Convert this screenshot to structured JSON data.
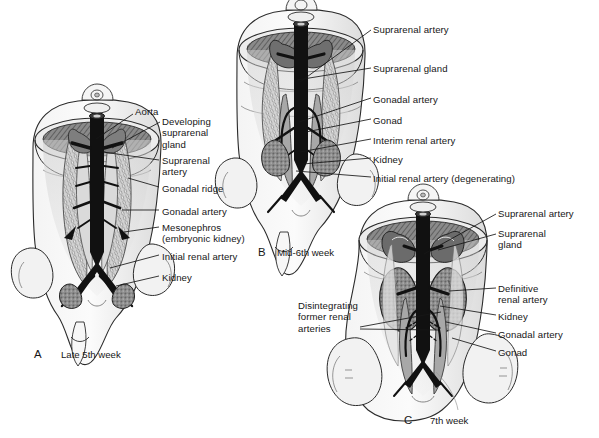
{
  "figure": {
    "background_color": "#ffffff",
    "ink_color": "#161616",
    "vessel_color": "#111111",
    "organ_gray": "#8d8d8d",
    "body_gray": "#e8e8e8",
    "panel_count": 3
  },
  "panels": [
    {
      "id": "A",
      "letter": "A",
      "caption": "Late 5th week",
      "letter_pos": {
        "x": 34,
        "y": 348
      },
      "caption_pos": {
        "x": 61,
        "y": 349
      },
      "labels": [
        {
          "name": "aorta",
          "text": "Aorta",
          "x": 135,
          "y": 106,
          "lines": [
            [
              133,
              114,
              96,
              139
            ]
          ]
        },
        {
          "name": "developing-suprarenal-gland",
          "text": "Developing\nsuprarenal\ngland",
          "x": 162,
          "y": 116,
          "lines": [
            [
              160,
              122,
              112,
              148
            ]
          ]
        },
        {
          "name": "suprarenal-artery",
          "text": "Suprarenal\nartery",
          "x": 162,
          "y": 155,
          "lines": [
            [
              159,
              160,
              103,
              152
            ]
          ]
        },
        {
          "name": "gonadal-ridge",
          "text": "Gonadal ridge",
          "x": 162,
          "y": 183,
          "lines": [
            [
              159,
              187,
              128,
              178
            ]
          ]
        },
        {
          "name": "gonadal-artery",
          "text": "Gonadal artery",
          "x": 162,
          "y": 206,
          "lines": [
            [
              159,
              210,
              122,
              210
            ]
          ]
        },
        {
          "name": "mesonephros",
          "text": "Mesonephros\n(embryonic kidney)",
          "x": 162,
          "y": 222,
          "lines": [
            [
              159,
              227,
              124,
              232
            ]
          ]
        },
        {
          "name": "initial-renal-artery",
          "text": "Initial renal artery",
          "x": 162,
          "y": 251,
          "lines": [
            [
              159,
              255,
              110,
              268
            ]
          ]
        },
        {
          "name": "kidney",
          "text": "Kidney",
          "x": 162,
          "y": 272,
          "lines": [
            [
              159,
              276,
              116,
              286
            ]
          ]
        }
      ]
    },
    {
      "id": "B",
      "letter": "B",
      "caption": "Mid-6th week",
      "letter_pos": {
        "x": 258,
        "y": 246
      },
      "caption_pos": {
        "x": 277,
        "y": 247
      },
      "labels": [
        {
          "name": "suprarenal-artery",
          "text": "Suprarenal artery",
          "x": 373,
          "y": 24,
          "lines": [
            [
              371,
              30,
              300,
              82
            ]
          ]
        },
        {
          "name": "suprarenal-gland",
          "text": "Suprarenal gland",
          "x": 373,
          "y": 63,
          "lines": [
            [
              371,
              68,
              297,
              80
            ]
          ]
        },
        {
          "name": "gonadal-artery",
          "text": "Gonadal artery",
          "x": 373,
          "y": 94,
          "lines": [
            [
              371,
              98,
              299,
              122
            ]
          ]
        },
        {
          "name": "gonad",
          "text": "Gonad",
          "x": 373,
          "y": 115,
          "lines": [
            [
              371,
              119,
              306,
              132
            ]
          ]
        },
        {
          "name": "interim-renal-artery",
          "text": "Interim renal artery",
          "x": 373,
          "y": 135,
          "lines": [
            [
              371,
              139,
              300,
              152
            ]
          ]
        },
        {
          "name": "kidney",
          "text": "Kidney",
          "x": 373,
          "y": 154,
          "lines": [
            [
              371,
              158,
              303,
              164
            ]
          ]
        },
        {
          "name": "initial-renal-artery-degenerating",
          "text": "Initial renal artery (degenerating)",
          "x": 373,
          "y": 173,
          "lines": [
            [
              371,
              177,
              296,
              171
            ]
          ]
        }
      ]
    },
    {
      "id": "C",
      "letter": "C",
      "caption": "7th week",
      "letter_pos": {
        "x": 404,
        "y": 414
      },
      "caption_pos": {
        "x": 430,
        "y": 415
      },
      "labels": [
        {
          "name": "suprarenal-artery",
          "text": "Suprarenal artery",
          "x": 498,
          "y": 208,
          "lines": [
            [
              496,
              214,
              424,
              254
            ]
          ]
        },
        {
          "name": "suprarenal-gland",
          "text": "Suprarenal\ngland",
          "x": 498,
          "y": 228,
          "lines": [
            [
              496,
              234,
              438,
              250
            ]
          ]
        },
        {
          "name": "definitive-renal-artery",
          "text": "Definitive\nrenal artery",
          "x": 498,
          "y": 283,
          "lines": [
            [
              496,
              288,
              449,
              291
            ]
          ]
        },
        {
          "name": "kidney",
          "text": "Kidney",
          "x": 498,
          "y": 311,
          "lines": [
            [
              496,
              315,
              440,
              306
            ]
          ]
        },
        {
          "name": "gonadal-artery",
          "text": "Gonadal artery",
          "x": 498,
          "y": 329,
          "lines": [
            [
              496,
              333,
              446,
              322
            ]
          ]
        },
        {
          "name": "gonad",
          "text": "Gonad",
          "x": 498,
          "y": 347,
          "lines": [
            [
              496,
              351,
              452,
              338
            ]
          ]
        },
        {
          "name": "disintegrating-former-renal-arteries",
          "text": "Disintegrating\nformer renal\narteries",
          "x": 298,
          "y": 300,
          "lines": [
            [
              360,
              327,
              441,
              312
            ],
            [
              360,
              329,
              438,
              330
            ]
          ]
        }
      ]
    }
  ]
}
